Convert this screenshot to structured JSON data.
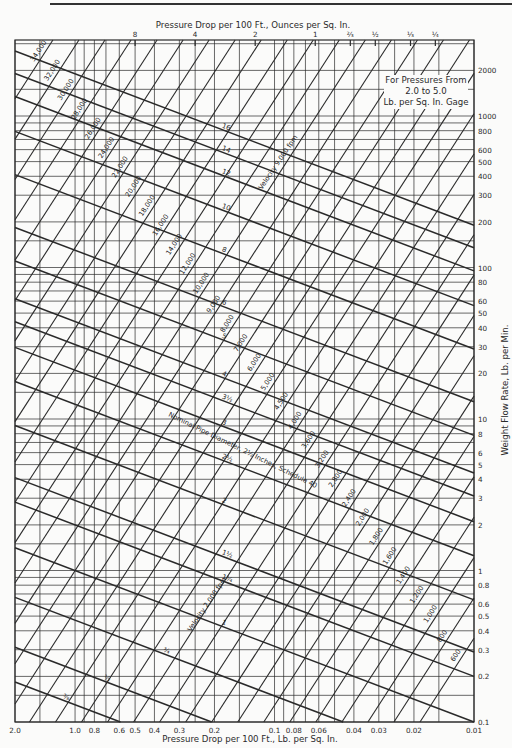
{
  "chart_data": {
    "type": "line",
    "annotation": [
      "For Pressures From",
      "2.0 to 5.0",
      "Lb. per Sq. In. Gage"
    ],
    "xlabel": "Pressure Drop per 100 Ft., Lb. per Sq. In.",
    "x2label": "Pressure Drop per 100 Ft., Ounces per Sq. In.",
    "ylabel": "Weight Flow Rate, Lb. per Min.",
    "xscale": "log (reversed)",
    "yscale": "log",
    "xlim": [
      2.0,
      0.01
    ],
    "ylim": [
      0.1,
      3000
    ],
    "grid": true,
    "x_ticks": [
      "2.0",
      "1.0",
      "0.8",
      "0.6",
      "0.5",
      "0.4",
      "0.3",
      "0.2",
      "0.1",
      "0.08",
      "0.06",
      "0.04",
      "0.03",
      "0.02",
      "0.01"
    ],
    "x_tick_values": [
      2.0,
      1.0,
      0.8,
      0.6,
      0.5,
      0.4,
      0.3,
      0.2,
      0.1,
      0.08,
      0.06,
      0.04,
      0.03,
      0.02,
      0.01
    ],
    "x2_ticks": [
      "8",
      "4",
      "2",
      "1",
      "⅔",
      "½",
      "⅓",
      "¼"
    ],
    "x2_tick_values_oz": [
      8,
      4,
      2,
      1,
      0.667,
      0.5,
      0.333,
      0.25
    ],
    "y_ticks": [
      "0.1",
      "0.2",
      "0.3",
      "0.4",
      "0.5",
      "0.6",
      "0.8",
      "1",
      "2",
      "3",
      "4",
      "5",
      "6",
      "8",
      "10",
      "20",
      "30",
      "40",
      "50",
      "60",
      "80",
      "100",
      "200",
      "300",
      "400",
      "500",
      "600",
      "800",
      "1000",
      "2000"
    ],
    "y_tick_values": [
      0.1,
      0.2,
      0.3,
      0.4,
      0.5,
      0.6,
      0.8,
      1,
      2,
      3,
      4,
      5,
      6,
      8,
      10,
      20,
      30,
      40,
      50,
      60,
      80,
      100,
      200,
      300,
      400,
      500,
      600,
      800,
      1000,
      2000
    ],
    "series_pipe_diameter": {
      "name": "Nominal Pipe Diameter, Inches, Schedule 40",
      "label_note": "Nominal Pipe Diameter, 2½ Inches, Schedule 40",
      "lines": [
        {
          "label": "16",
          "flow_at_dp_1psi": 1900
        },
        {
          "label": "14",
          "flow_at_dp_1psi": 1350
        },
        {
          "label": "12",
          "flow_at_dp_1psi": 950
        },
        {
          "label": "10",
          "flow_at_dp_1psi": 560
        },
        {
          "label": "8",
          "flow_at_dp_1psi": 290
        },
        {
          "label": "6",
          "flow_at_dp_1psi": 130
        },
        {
          "label": "5",
          "flow_at_dp_1psi": 78
        },
        {
          "label": "4",
          "flow_at_dp_1psi": 44
        },
        {
          "label": "3½",
          "flow_at_dp_1psi": 31
        },
        {
          "label": "3",
          "flow_at_dp_1psi": 21
        },
        {
          "label": "2½",
          "flow_at_dp_1psi": 12.5
        },
        {
          "label": "2",
          "flow_at_dp_1psi": 6.4
        },
        {
          "label": "1½",
          "flow_at_dp_1psi": 2.9
        },
        {
          "label": "1¼",
          "flow_at_dp_1psi": 2.0
        },
        {
          "label": "1",
          "flow_at_dp_1psi": 1.0
        },
        {
          "label": "¾",
          "flow_at_dp_1psi": 0.47
        },
        {
          "label": "½",
          "flow_at_dp_1psi": 0.22
        },
        {
          "label": "⅜",
          "flow_at_dp_1psi": 0.13
        }
      ]
    },
    "series_velocity": {
      "name": "Velocity, fpm",
      "labels_note": [
        "Velocity 9,000 fpm",
        "Velocity 2,000 fpm"
      ],
      "lines": [
        "34,000",
        "32,000",
        "30,000",
        "28,000",
        "26,000",
        "24,000",
        "22,000",
        "20,000",
        "18,000",
        "16,000",
        "14,000",
        "12,000",
        "10,000",
        "9,000",
        "8,000",
        "7,000",
        "6,000",
        "5,000",
        "4,500",
        "4,000",
        "3,600",
        "3,200",
        "2,800",
        "2,400",
        "2,000",
        "1,800",
        "1,600",
        "1,400",
        "1,200",
        "1,000",
        "800",
        "600"
      ]
    }
  },
  "labels": {
    "x_title": "Pressure Drop per 100 Ft., Lb. per Sq. In.",
    "x2_title": "Pressure Drop per 100 Ft., Ounces per Sq. In.",
    "y_title": "Weight Flow Rate, Lb. per Min.",
    "note_line1": "For Pressures From",
    "note_line2": "2.0 to 5.0",
    "note_line3": "Lb. per Sq. In. Gage",
    "pipe_note": "Nominal Pipe Diameter, 2½ Inches, Schedule 40",
    "vel_note_high": "Velocity 9,000 fpm",
    "vel_note_low": "Velocity 2,000 fpm"
  },
  "colors": {
    "ink": "#2a2a2a",
    "paper": "#fbfbfa"
  }
}
